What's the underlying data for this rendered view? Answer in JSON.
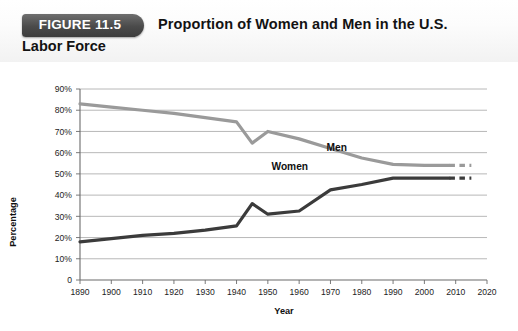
{
  "figure": {
    "badge_label": "FIGURE 11.5",
    "title_line1": "Proportion of Women and Men in the U.S.",
    "title_line2": "Labor Force"
  },
  "colors": {
    "men_line": "#9a9a9a",
    "women_line": "#3b3b3b",
    "gridline": "#b0b0b0",
    "axis": "#6b6b6b",
    "badge_bg": "#4a4a4a",
    "text": "#131313"
  },
  "chart_data": {
    "type": "line",
    "title": "Proportion of Women and Men in the U.S. Labor Force",
    "xlabel": "Year",
    "ylabel": "Percentage",
    "xlim": [
      1890,
      2020
    ],
    "ylim": [
      0,
      90
    ],
    "grid": true,
    "legend_position": "inline-labels",
    "x_tick_labels": [
      "1890",
      "1900",
      "1910",
      "1920",
      "1930",
      "1940",
      "1950",
      "1960",
      "1970",
      "1980",
      "1990",
      "2000",
      "2010",
      "2020"
    ],
    "y_tick_labels": [
      "0",
      "10%",
      "20%",
      "30%",
      "40%",
      "50%",
      "60%",
      "70%",
      "80%",
      "90%"
    ],
    "x_ticks": [
      1890,
      1900,
      1910,
      1920,
      1930,
      1940,
      1950,
      1960,
      1970,
      1980,
      1990,
      2000,
      2010,
      2020
    ],
    "y_ticks": [
      0,
      10,
      20,
      30,
      40,
      50,
      60,
      70,
      80,
      90
    ],
    "series": [
      {
        "name": "Men",
        "color": "#9a9a9a",
        "label_text": "Men",
        "label_x": 1972,
        "label_y": 61,
        "x": [
          1890,
          1900,
          1910,
          1920,
          1930,
          1940,
          1945,
          1950,
          1960,
          1970,
          1980,
          1990,
          2000,
          2008
        ],
        "values": [
          83.0,
          81.5,
          80.0,
          78.5,
          76.5,
          74.5,
          64.5,
          70.0,
          66.5,
          62.0,
          57.5,
          54.5,
          54.0,
          54.0
        ],
        "projection": {
          "x": [
            2008,
            2015
          ],
          "values": [
            54.0,
            54.0
          ],
          "style": "dashed"
        }
      },
      {
        "name": "Women",
        "color": "#3b3b3b",
        "label_text": "Women",
        "label_x": 1957,
        "label_y": 52,
        "x": [
          1890,
          1900,
          1910,
          1920,
          1930,
          1940,
          1945,
          1950,
          1960,
          1970,
          1980,
          1990,
          2000,
          2008
        ],
        "values": [
          18.0,
          19.5,
          21.0,
          22.0,
          23.5,
          25.5,
          36.0,
          31.0,
          32.5,
          42.5,
          45.0,
          48.0,
          48.0,
          48.0
        ],
        "projection": {
          "x": [
            2008,
            2015
          ],
          "values": [
            48.0,
            48.0
          ],
          "style": "dashed"
        }
      }
    ]
  }
}
